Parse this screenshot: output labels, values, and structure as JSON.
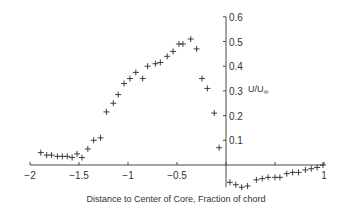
{
  "chart_data": {
    "type": "scatter",
    "title": "",
    "xlabel": "Distance to Center of Core, Fraction of chord",
    "ylabel": "U/U∞",
    "xlim": [
      -2,
      1
    ],
    "ylim": [
      -0.1,
      0.6
    ],
    "grid": false,
    "legend": null,
    "x_ticks": [
      -2,
      -1.5,
      -1,
      -0.5,
      0,
      0.5,
      1
    ],
    "x_tick_labels": [
      "−2",
      "−1.5",
      "−1",
      "−0.5",
      "",
      "",
      "1"
    ],
    "y_ticks": [
      0.1,
      0.2,
      0.3,
      0.4,
      0.5,
      0.6
    ],
    "y_tick_labels": [
      "0.1",
      "0.2",
      "0.3",
      "0.4",
      "0.5",
      "0.6"
    ],
    "marker": "plus",
    "series": [
      {
        "name": "U/U∞",
        "x": [
          -1.89,
          -1.83,
          -1.78,
          -1.72,
          -1.67,
          -1.62,
          -1.57,
          -1.52,
          -1.47,
          -1.41,
          -1.35,
          -1.28,
          -1.22,
          -1.15,
          -1.1,
          -1.04,
          -0.98,
          -0.92,
          -0.85,
          -0.8,
          -0.72,
          -0.67,
          -0.6,
          -0.54,
          -0.48,
          -0.44,
          -0.36,
          -0.3,
          -0.245,
          -0.19,
          -0.12,
          -0.07,
          0.04,
          0.1,
          0.16,
          0.22,
          0.31,
          0.37,
          0.43,
          0.5,
          0.55,
          0.62,
          0.68,
          0.74,
          0.81,
          0.87,
          0.93,
          0.99
        ],
        "y": [
          0.05,
          0.04,
          0.04,
          0.035,
          0.035,
          0.035,
          0.03,
          0.045,
          0.03,
          0.065,
          0.1,
          0.11,
          0.215,
          0.25,
          0.285,
          0.33,
          0.35,
          0.375,
          0.35,
          0.4,
          0.41,
          0.415,
          0.44,
          0.46,
          0.49,
          0.49,
          0.51,
          0.47,
          0.35,
          0.31,
          0.21,
          0.07,
          -0.07,
          -0.08,
          -0.09,
          -0.085,
          -0.06,
          -0.055,
          -0.05,
          -0.05,
          -0.05,
          -0.035,
          -0.03,
          -0.03,
          -0.02,
          -0.015,
          -0.01,
          0.0
        ]
      }
    ]
  },
  "labels": {
    "xlabel": "Distance to Center of Core, Fraction of chord",
    "ylabel_main": "U/U",
    "ylabel_sub": "∞"
  }
}
